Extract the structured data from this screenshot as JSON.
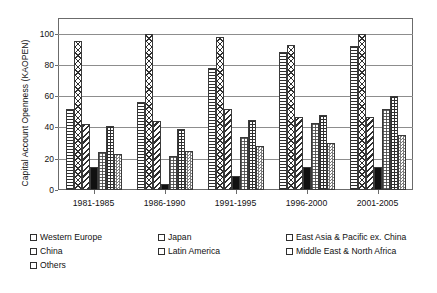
{
  "chart_data": {
    "type": "bar",
    "title": "",
    "xlabel": "",
    "ylabel": "Capital Account Openness (KAOPEN)",
    "ylim": [
      0,
      110
    ],
    "yticks": [
      0,
      20,
      40,
      60,
      80,
      100
    ],
    "grid": true,
    "legend_position": "bottom",
    "categories": [
      "1981-1985",
      "1986-1990",
      "1991-1995",
      "1996-2000",
      "2001-2005"
    ],
    "series": [
      {
        "name": "Western Europe",
        "pattern": "horizontal-lines",
        "values": [
          52,
          56,
          78,
          88,
          92
        ]
      },
      {
        "name": "Japan",
        "pattern": "cross-hatch",
        "values": [
          95,
          100,
          98,
          93,
          100
        ]
      },
      {
        "name": "East Asia & Pacific ex. China",
        "pattern": "diagonal-lines",
        "values": [
          42,
          44,
          52,
          47,
          47
        ]
      },
      {
        "name": "China",
        "pattern": "solid-black",
        "values": [
          15,
          4,
          9,
          15,
          15
        ]
      },
      {
        "name": "Latin America",
        "pattern": "fine-dots",
        "values": [
          24,
          22,
          34,
          43,
          52
        ]
      },
      {
        "name": "Middle East & North Africa",
        "pattern": "grid",
        "values": [
          41,
          39,
          45,
          48,
          60
        ]
      },
      {
        "name": "Others",
        "pattern": "checkerboard",
        "values": [
          23,
          25,
          28,
          30,
          35
        ]
      }
    ]
  },
  "axis": {
    "y_title": "Capital Account Openness (KAOPEN)"
  }
}
